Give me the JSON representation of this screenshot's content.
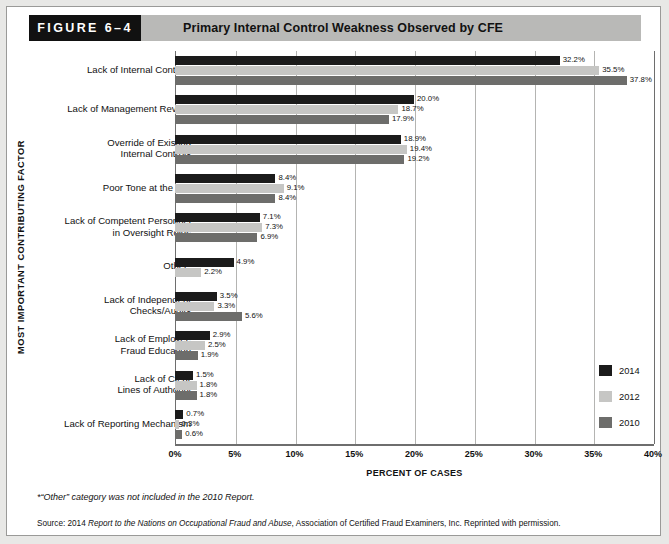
{
  "figure": {
    "number_label": "FIGURE 6–4",
    "title": "Primary Internal Control Weakness Observed by CFE"
  },
  "axes": {
    "y_axis_title": "MOST IMPORTANT CONTRIBUTING FACTOR",
    "x_axis_title": "PERCENT OF CASES",
    "x_ticks": [
      "0%",
      "5%",
      "10%",
      "15%",
      "20%",
      "25%",
      "30%",
      "35%",
      "40%"
    ]
  },
  "legend": {
    "position": "right-middle",
    "entries": [
      {
        "label": "2014",
        "color": "#1b1b1b"
      },
      {
        "label": "2012",
        "color": "#c6c6c4"
      },
      {
        "label": "2010",
        "color": "#6d6d6b"
      }
    ]
  },
  "notes": {
    "footnote": "*“Other” category was not included in the 2010 Report.",
    "source_prefix": "Source: 2014 ",
    "source_italic": "Report to the Nations on Occupational Fraud and Abuse",
    "source_suffix": ", Association of Certified Fraud Examiners, Inc. Reprinted with permission."
  },
  "chart_data": {
    "type": "bar",
    "orientation": "horizontal",
    "title": "Primary Internal Control Weakness Observed by CFE",
    "xlabel": "PERCENT OF CASES",
    "ylabel": "MOST IMPORTANT CONTRIBUTING FACTOR",
    "xlim": [
      0,
      40
    ],
    "xticks": [
      0,
      5,
      10,
      15,
      20,
      25,
      30,
      35,
      40
    ],
    "grid": true,
    "grid_axis": "x",
    "legend_position": "right",
    "categories": [
      "Lack of Internal Controls",
      "Lack of Management Review",
      "Override of Existing\nInternal Controls",
      "Poor Tone at the Top",
      "Lack of Competent Personnel\nin Oversight Roles",
      "Other*",
      "Lack of Independent\nChecks/Audits",
      "Lack of Employee\nFraud Education",
      "Lack of Clear\nLines of Authority",
      "Lack of Reporting Mechanism"
    ],
    "series": [
      {
        "name": "2014",
        "color": "#1b1b1b",
        "values": [
          32.2,
          20.0,
          18.9,
          8.4,
          7.1,
          4.9,
          3.5,
          2.9,
          1.5,
          0.7
        ],
        "labels": [
          "32.2%",
          "20.0%",
          "18.9%",
          "8.4%",
          "7.1%",
          "4.9%",
          "3.5%",
          "2.9%",
          "1.5%",
          "0.7%"
        ]
      },
      {
        "name": "2012",
        "color": "#c6c6c4",
        "values": [
          35.5,
          18.7,
          19.4,
          9.1,
          7.3,
          2.2,
          3.3,
          2.5,
          1.8,
          0.3
        ],
        "labels": [
          "35.5%",
          "18.7%",
          "19.4%",
          "9.1%",
          "7.3%",
          "2.2%",
          "3.3%",
          "2.5%",
          "1.8%",
          "0.3%"
        ]
      },
      {
        "name": "2010",
        "color": "#6d6d6b",
        "values": [
          37.8,
          17.9,
          19.2,
          8.4,
          6.9,
          null,
          5.6,
          1.9,
          1.8,
          0.6
        ],
        "labels": [
          "37.8%",
          "17.9%",
          "19.2%",
          "8.4%",
          "6.9%",
          "",
          "5.6%",
          "1.9%",
          "1.8%",
          "0.6%"
        ]
      }
    ]
  }
}
